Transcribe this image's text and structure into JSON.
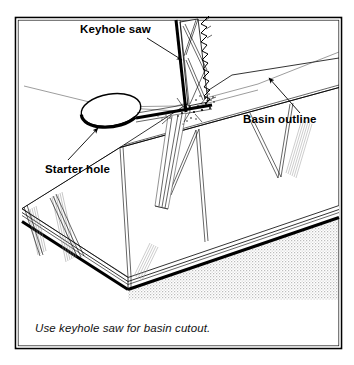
{
  "figure": {
    "kind": "technical-line-illustration",
    "frame": {
      "border_color": "#000000",
      "background_color": "#ffffff"
    },
    "labels": [
      {
        "id": "keyhole-saw",
        "text": "Keyhole saw",
        "style": "bold",
        "x": 80,
        "y": 32,
        "leader": {
          "from": [
            147,
            38
          ],
          "to": [
            184,
            62
          ],
          "arrow": "to"
        }
      },
      {
        "id": "basin-outline",
        "text": "Basin outline",
        "style": "bold",
        "x": 243,
        "y": 122,
        "leader": {
          "from": [
            300,
            112
          ],
          "to": [
            267,
            76
          ],
          "arrow": "to"
        }
      },
      {
        "id": "starter-hole",
        "text": "Starter hole",
        "style": "bold",
        "x": 45,
        "y": 172,
        "leader": {
          "from": [
            70,
            158
          ],
          "to": [
            99,
            127
          ],
          "arrow": "to"
        }
      }
    ],
    "caption": {
      "text": "Use keyhole saw for basin cutout.",
      "style": "italic",
      "x": 35,
      "y": 332
    },
    "elements": [
      {
        "name": "countertop-top-surface",
        "type": "polygon"
      },
      {
        "name": "countertop-front-edge",
        "type": "thick-line"
      },
      {
        "name": "cabinet-shadow",
        "type": "stipple-fill",
        "color": "#c9c9c9"
      },
      {
        "name": "basin-outline-line",
        "type": "thin-line"
      },
      {
        "name": "starter-hole-ellipse",
        "type": "ellipse"
      },
      {
        "name": "saw-blade",
        "type": "toothed-blade"
      },
      {
        "name": "saw-handle-spine",
        "type": "thick-line"
      },
      {
        "name": "sawdust-debris",
        "type": "speckles"
      }
    ],
    "colors": {
      "ink": "#000000",
      "paper": "#ffffff",
      "stipple": "#c9c9c9",
      "hairline": "#3a3a3a"
    }
  }
}
